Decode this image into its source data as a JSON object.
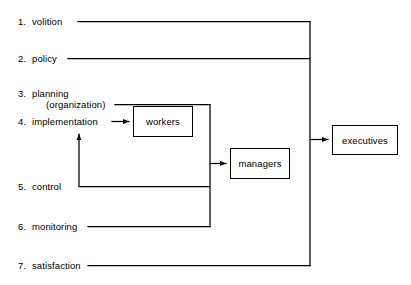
{
  "diagram": {
    "background_color": "#ffffff",
    "line_color": "#000000",
    "stages": [
      {
        "number": "1.",
        "label": "volition",
        "sublabel": ""
      },
      {
        "number": "2.",
        "label": "policy",
        "sublabel": ""
      },
      {
        "number": "3.",
        "label": "planning",
        "sublabel": "(organization)"
      },
      {
        "number": "4.",
        "label": "implementation",
        "sublabel": ""
      },
      {
        "number": "5.",
        "label": "control",
        "sublabel": ""
      },
      {
        "number": "6.",
        "label": "monitoring",
        "sublabel": ""
      },
      {
        "number": "7.",
        "label": "satisfaction",
        "sublabel": ""
      }
    ],
    "nodes": [
      {
        "id": "workers",
        "label": "workers"
      },
      {
        "id": "managers",
        "label": "managers"
      },
      {
        "id": "executives",
        "label": "executives"
      }
    ],
    "connections": [
      {
        "from": "volition",
        "to": "executives"
      },
      {
        "from": "policy",
        "to": "executives"
      },
      {
        "from": "satisfaction",
        "to": "executives"
      },
      {
        "from": "(organization)",
        "to": "managers"
      },
      {
        "from": "control",
        "to": "managers"
      },
      {
        "from": "monitoring",
        "to": "managers"
      },
      {
        "from": "implementation",
        "to": "workers"
      },
      {
        "from": "control",
        "to": "implementation"
      }
    ]
  }
}
